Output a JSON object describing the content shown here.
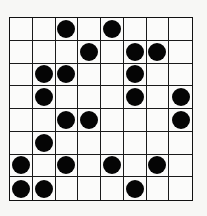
{
  "board": {
    "rows": 8,
    "cols": 8,
    "stone_color": "#050505",
    "grid_color": "#1a1a1a",
    "stones": [
      [
        0,
        0,
        1,
        0,
        1,
        0,
        0,
        0
      ],
      [
        0,
        0,
        0,
        1,
        0,
        1,
        1,
        0
      ],
      [
        0,
        1,
        1,
        0,
        0,
        1,
        0,
        0
      ],
      [
        0,
        1,
        0,
        0,
        0,
        1,
        0,
        1
      ],
      [
        0,
        0,
        1,
        1,
        0,
        0,
        0,
        1
      ],
      [
        0,
        1,
        0,
        0,
        0,
        0,
        0,
        0
      ],
      [
        1,
        0,
        1,
        0,
        1,
        0,
        1,
        0
      ],
      [
        1,
        1,
        0,
        0,
        0,
        1,
        0,
        0
      ]
    ]
  }
}
